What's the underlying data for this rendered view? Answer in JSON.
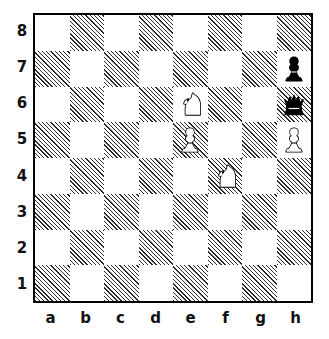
{
  "diagram": {
    "type": "chessboard",
    "orientation": "white-bottom",
    "files": [
      "a",
      "b",
      "c",
      "d",
      "e",
      "f",
      "g",
      "h"
    ],
    "ranks": [
      "8",
      "7",
      "6",
      "5",
      "4",
      "3",
      "2",
      "1"
    ],
    "colors": {
      "light_square": "#ffffff",
      "dark_square_hatch": "#2b2b2b",
      "border": "#000000",
      "label_text": "#111111",
      "white_piece_fill": "#ffffff",
      "black_piece_fill": "#000000"
    },
    "pieces": [
      {
        "square": "h7",
        "color": "black",
        "type": "pawn",
        "glyph": "black-pawn-icon"
      },
      {
        "square": "e6",
        "color": "white",
        "type": "knight",
        "glyph": "white-knight-icon"
      },
      {
        "square": "h6",
        "color": "black",
        "type": "queen",
        "glyph": "black-queen-icon"
      },
      {
        "square": "e5",
        "color": "white",
        "type": "pawn",
        "glyph": "white-pawn-icon"
      },
      {
        "square": "h5",
        "color": "white",
        "type": "pawn",
        "glyph": "white-pawn-icon"
      },
      {
        "square": "f4",
        "color": "white",
        "type": "knight",
        "glyph": "white-knight-icon"
      }
    ],
    "fen_position": "8/7p/4N2q/4P2P/5N2/8/8/8"
  }
}
